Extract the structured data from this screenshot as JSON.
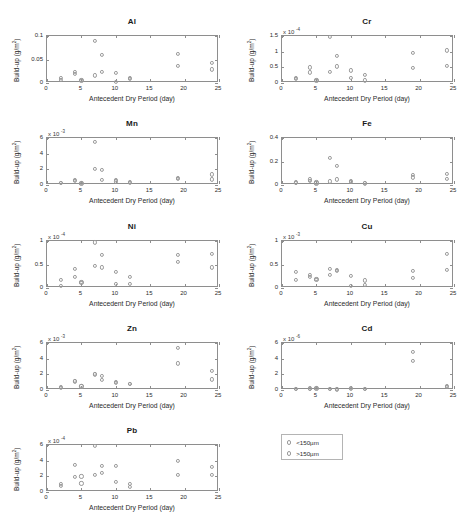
{
  "figure": {
    "xlabel": "Antecedent Dry Period (day)",
    "ylabel_prefix": "Build-up (g/m",
    "ylabel_sup": "2",
    "ylabel_suffix": ")",
    "xticks": [
      "0",
      "5",
      "10",
      "15",
      "20",
      "25"
    ],
    "xlim": [
      0,
      25
    ],
    "marker_color": "#9a9a9a",
    "axis_color": "#8e8e8e"
  },
  "legend": {
    "position": "bottom-right",
    "entries": [
      {
        "marker": "open-circle",
        "label": "<150µm"
      },
      {
        "marker": "open-circle",
        "label": ">150µm"
      }
    ]
  },
  "chart_data": [
    {
      "type": "scatter",
      "title": "Al",
      "xlabel": "Antecedent Dry Period (day)",
      "ylabel": "Build-up (g/m2)",
      "exponent": null,
      "exponent_label": "",
      "xlim": [
        0,
        25
      ],
      "ylim": [
        0,
        0.1
      ],
      "yticks": [
        "0",
        "0.05",
        "0.1"
      ],
      "ytickvals": [
        0,
        0.05,
        0.1
      ],
      "grid": false,
      "series": [
        {
          "name": "<150µm",
          "points": [
            [
              2,
              0.011
            ],
            [
              4,
              0.023
            ],
            [
              5,
              0.007
            ],
            [
              7,
              0.09
            ],
            [
              8,
              0.023
            ],
            [
              10,
              0.021
            ],
            [
              12,
              0.011
            ],
            [
              19,
              0.062
            ],
            [
              24,
              0.043
            ]
          ]
        },
        {
          "name": ">150µm",
          "points": [
            [
              2,
              0.007
            ],
            [
              4,
              0.02
            ],
            [
              5,
              0.004
            ],
            [
              7,
              0.016
            ],
            [
              8,
              0.06
            ],
            [
              10,
              0.003
            ],
            [
              12,
              0.008
            ],
            [
              19,
              0.036
            ],
            [
              24,
              0.029
            ]
          ]
        }
      ]
    },
    {
      "type": "scatter",
      "title": "Cr",
      "xlabel": "Antecedent Dry Period (day)",
      "ylabel": "Build-up (g/m2)",
      "exponent": -4,
      "exponent_label": "x 10",
      "xlim": [
        0,
        25
      ],
      "ylim": [
        0,
        1.5
      ],
      "yticks": [
        "0",
        "0.5",
        "1",
        "1.5"
      ],
      "ytickvals": [
        0,
        0.5,
        1,
        1.5
      ],
      "grid": false,
      "series": [
        {
          "name": "<150µm",
          "points": [
            [
              2,
              0.16
            ],
            [
              4,
              0.5
            ],
            [
              5,
              0.1
            ],
            [
              7,
              1.47
            ],
            [
              8,
              0.86
            ],
            [
              10,
              0.4
            ],
            [
              12,
              0.25
            ],
            [
              19,
              0.97
            ],
            [
              24,
              1.04
            ]
          ]
        },
        {
          "name": ">150µm",
          "points": [
            [
              2,
              0.12
            ],
            [
              4,
              0.34
            ],
            [
              5,
              0.07
            ],
            [
              7,
              0.36
            ],
            [
              8,
              0.53
            ],
            [
              10,
              0.15
            ],
            [
              12,
              0.08
            ],
            [
              19,
              0.49
            ],
            [
              24,
              0.55
            ]
          ]
        }
      ]
    },
    {
      "type": "scatter",
      "title": "Mn",
      "xlabel": "Antecedent Dry Period (day)",
      "ylabel": "Build-up (g/m2)",
      "exponent": -3,
      "exponent_label": "x 10",
      "xlim": [
        0,
        25
      ],
      "ylim": [
        0,
        6
      ],
      "yticks": [
        "0",
        "2",
        "4",
        "6"
      ],
      "ytickvals": [
        0,
        2,
        4,
        6
      ],
      "grid": false,
      "series": [
        {
          "name": "<150µm",
          "points": [
            [
              2,
              0.28
            ],
            [
              4,
              0.7
            ],
            [
              5,
              0.3
            ],
            [
              7,
              5.5
            ],
            [
              8,
              1.95
            ],
            [
              10,
              0.6
            ],
            [
              12,
              0.35
            ],
            [
              19,
              0.95
            ],
            [
              24,
              1.35
            ]
          ]
        },
        {
          "name": ">150µm",
          "points": [
            [
              2,
              0.22
            ],
            [
              4,
              0.52
            ],
            [
              5,
              0.15
            ],
            [
              7,
              2.05
            ],
            [
              8,
              0.7
            ],
            [
              10,
              0.45
            ],
            [
              12,
              0.25
            ],
            [
              19,
              0.8
            ],
            [
              24,
              0.72
            ]
          ]
        }
      ]
    },
    {
      "type": "scatter",
      "title": "Fe",
      "xlabel": "Antecedent Dry Period (day)",
      "ylabel": "Build-up (g/m2)",
      "exponent": null,
      "exponent_label": "",
      "xlim": [
        0,
        25
      ],
      "ylim": [
        0,
        0.4
      ],
      "yticks": [
        "0",
        "0.2",
        "0.4"
      ],
      "ytickvals": [
        0,
        0.2,
        0.4
      ],
      "grid": false,
      "series": [
        {
          "name": "<150µm",
          "points": [
            [
              2,
              0.022
            ],
            [
              4,
              0.048
            ],
            [
              5,
              0.022
            ],
            [
              7,
              0.23
            ],
            [
              8,
              0.165
            ],
            [
              10,
              0.038
            ],
            [
              12,
              0.018
            ],
            [
              19,
              0.085
            ],
            [
              24,
              0.095
            ]
          ]
        },
        {
          "name": ">150µm",
          "points": [
            [
              2,
              0.018
            ],
            [
              4,
              0.038
            ],
            [
              5,
              0.014
            ],
            [
              7,
              0.03
            ],
            [
              8,
              0.048
            ],
            [
              10,
              0.026
            ],
            [
              12,
              0.013
            ],
            [
              19,
              0.065
            ],
            [
              24,
              0.05
            ]
          ]
        }
      ]
    },
    {
      "type": "scatter",
      "title": "Ni",
      "xlabel": "Antecedent Dry Period (day)",
      "ylabel": "Build-up (g/m2)",
      "exponent": -4,
      "exponent_label": "x 10",
      "xlim": [
        0,
        25
      ],
      "ylim": [
        0,
        1
      ],
      "yticks": [
        "0",
        "0.5",
        "1"
      ],
      "ytickvals": [
        0,
        0.5,
        1
      ],
      "grid": false,
      "series": [
        {
          "name": "<150µm",
          "points": [
            [
              2,
              0.18
            ],
            [
              4,
              0.4
            ],
            [
              5,
              0.13
            ],
            [
              7,
              0.97
            ],
            [
              8,
              0.71
            ],
            [
              10,
              0.35
            ],
            [
              12,
              0.23
            ],
            [
              19,
              0.7
            ],
            [
              24,
              0.73
            ]
          ]
        },
        {
          "name": ">150µm",
          "points": [
            [
              2,
              0.04
            ],
            [
              4,
              0.24
            ],
            [
              5,
              0.1
            ],
            [
              7,
              0.47
            ],
            [
              8,
              0.44
            ],
            [
              10,
              0.08
            ],
            [
              12,
              0.08
            ],
            [
              19,
              0.56
            ],
            [
              24,
              0.44
            ]
          ]
        }
      ]
    },
    {
      "type": "scatter",
      "title": "Cu",
      "xlabel": "Antecedent Dry Period (day)",
      "ylabel": "Build-up (g/m2)",
      "exponent": -3,
      "exponent_label": "x 10",
      "xlim": [
        0,
        25
      ],
      "ylim": [
        0,
        1
      ],
      "yticks": [
        "0",
        "0.5",
        "1"
      ],
      "ytickvals": [
        0,
        0.5,
        1
      ],
      "grid": false,
      "series": [
        {
          "name": "<150µm",
          "points": [
            [
              2,
              0.35
            ],
            [
              4,
              0.27
            ],
            [
              5,
              0.19
            ],
            [
              7,
              0.4
            ],
            [
              8,
              0.39
            ],
            [
              10,
              0.25
            ],
            [
              12,
              0.16
            ],
            [
              19,
              0.37
            ],
            [
              24,
              0.72
            ]
          ]
        },
        {
          "name": ">150µm",
          "points": [
            [
              2,
              0.17
            ],
            [
              4,
              0.24
            ],
            [
              5,
              0.18
            ],
            [
              7,
              0.28
            ],
            [
              8,
              0.37
            ],
            [
              10,
              0.04
            ],
            [
              12,
              0.06
            ],
            [
              19,
              0.21
            ],
            [
              24,
              0.38
            ]
          ]
        }
      ]
    },
    {
      "type": "scatter",
      "title": "Zn",
      "xlabel": "Antecedent Dry Period (day)",
      "ylabel": "Build-up (g/m2)",
      "exponent": -3,
      "exponent_label": "x 10",
      "xlim": [
        0,
        25
      ],
      "ylim": [
        0,
        6
      ],
      "yticks": [
        "0",
        "2",
        "4",
        "6"
      ],
      "ytickvals": [
        0,
        2,
        4,
        6
      ],
      "grid": false,
      "series": [
        {
          "name": "<150µm",
          "points": [
            [
              2,
              0.4
            ],
            [
              4,
              1.2
            ],
            [
              5,
              0.55
            ],
            [
              7,
              2.1
            ],
            [
              8,
              1.75
            ],
            [
              10,
              1.0
            ],
            [
              12,
              0.8
            ],
            [
              19,
              5.35
            ],
            [
              24,
              2.4
            ]
          ]
        },
        {
          "name": ">150µm",
          "points": [
            [
              2,
              0.3
            ],
            [
              4,
              1.1
            ],
            [
              5,
              0.45
            ],
            [
              7,
              2.0
            ],
            [
              8,
              1.25
            ],
            [
              10,
              0.9
            ],
            [
              12,
              0.75
            ],
            [
              19,
              3.4
            ],
            [
              24,
              1.35
            ]
          ]
        }
      ]
    },
    {
      "type": "scatter",
      "title": "Cd",
      "xlabel": "Antecedent Dry Period (day)",
      "ylabel": "Build-up (g/m2)",
      "exponent": -6,
      "exponent_label": "x 10",
      "xlim": [
        0,
        25
      ],
      "ylim": [
        0,
        6
      ],
      "yticks": [
        "0",
        "2",
        "4",
        "6"
      ],
      "ytickvals": [
        0,
        2,
        4,
        6
      ],
      "grid": false,
      "series": [
        {
          "name": "<150µm",
          "points": [
            [
              2,
              0.18
            ],
            [
              4,
              0.2
            ],
            [
              5,
              0.25
            ],
            [
              7,
              0.18
            ],
            [
              8,
              0.12
            ],
            [
              10,
              0.25
            ],
            [
              12,
              0.15
            ],
            [
              19,
              4.85
            ],
            [
              24,
              0.5
            ]
          ]
        },
        {
          "name": ">150µm",
          "points": [
            [
              2,
              0.12
            ],
            [
              4,
              0.14
            ],
            [
              5,
              0.16
            ],
            [
              7,
              0.1
            ],
            [
              8,
              0.08
            ],
            [
              10,
              0.18
            ],
            [
              12,
              0.1
            ],
            [
              19,
              3.7
            ],
            [
              24,
              0.35
            ]
          ]
        }
      ]
    },
    {
      "type": "scatter",
      "title": "Pb",
      "xlabel": "Antecedent Dry Period (day)",
      "ylabel": "Build-up (g/m2)",
      "exponent": -4,
      "exponent_label": "x 10",
      "xlim": [
        0,
        25
      ],
      "ylim": [
        0,
        6
      ],
      "yticks": [
        "0",
        "2",
        "4",
        "6"
      ],
      "ytickvals": [
        0,
        2,
        4,
        6
      ],
      "grid": false,
      "series": [
        {
          "name": "<150µm",
          "points": [
            [
              2,
              1.05
            ],
            [
              4,
              3.45
            ],
            [
              5,
              2.0
            ],
            [
              7,
              5.85
            ],
            [
              8,
              3.35
            ],
            [
              10,
              3.3
            ],
            [
              12,
              1.0
            ],
            [
              19,
              3.95
            ],
            [
              24,
              3.25
            ]
          ]
        },
        {
          "name": ">150µm",
          "points": [
            [
              2,
              0.75
            ],
            [
              4,
              1.95
            ],
            [
              5,
              1.1
            ],
            [
              7,
              2.15
            ],
            [
              8,
              2.45
            ],
            [
              10,
              1.25
            ],
            [
              12,
              0.6
            ],
            [
              19,
              2.2
            ],
            [
              24,
              2.15
            ]
          ]
        }
      ]
    }
  ]
}
